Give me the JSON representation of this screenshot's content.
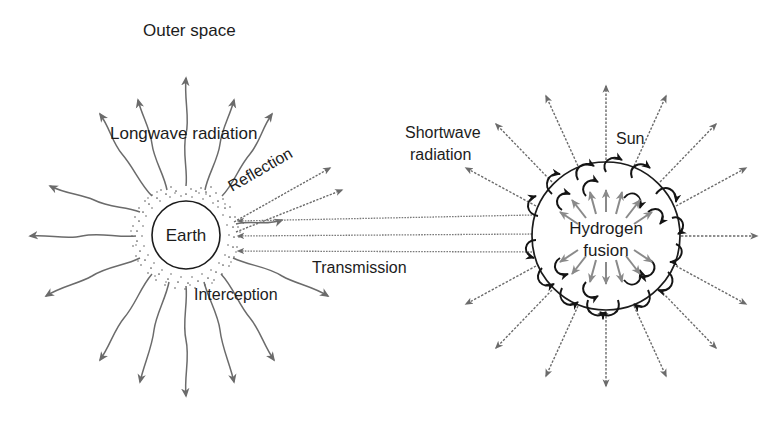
{
  "diagram": {
    "background_color": "#ffffff",
    "line_color": "#6b6b6b",
    "dark_line_color": "#1c1c1c",
    "text_color": "#1c1c1c",
    "labels": {
      "outer_space": "Outer space",
      "longwave_radiation": "Longwave radiation",
      "reflection": "Reflection",
      "interception": "Interception",
      "transmission": "Transmission",
      "shortwave_radiation_line1": "Shortwave",
      "shortwave_radiation_line2": "radiation",
      "sun": "Sun",
      "earth": "Earth",
      "hydrogen_line1": "Hydrogen",
      "hydrogen_line2": "fusion"
    },
    "bodies": {
      "earth": {
        "name": "Earth",
        "center_x": 186,
        "center_y": 235,
        "radius": 34,
        "atmosphere_outer_radius": 51,
        "atmosphere_style": "stippled"
      },
      "sun": {
        "name": "Sun",
        "center_x": 606,
        "center_y": 236,
        "radius": 74,
        "interior": "Hydrogen fusion"
      }
    },
    "flows": {
      "longwave_emission": {
        "label": "Longwave radiation",
        "source": "Earth",
        "direction": "outward",
        "style": "wavy",
        "ray_count": 16
      },
      "shortwave_emission": {
        "label": "Shortwave radiation",
        "source": "Sun",
        "direction": "outward",
        "style": "dashed-zigzag",
        "ray_count": 16
      },
      "transmission": {
        "label": "Transmission",
        "from": "Sun",
        "to": "Earth",
        "style": "zigzag",
        "beam_count": 3
      },
      "reflection": {
        "label": "Reflection",
        "from": "Earth",
        "direction": "up-right",
        "style": "zigzag",
        "beam_count": 2
      },
      "interception": {
        "label": "Interception",
        "at": "Earth atmosphere"
      }
    }
  }
}
